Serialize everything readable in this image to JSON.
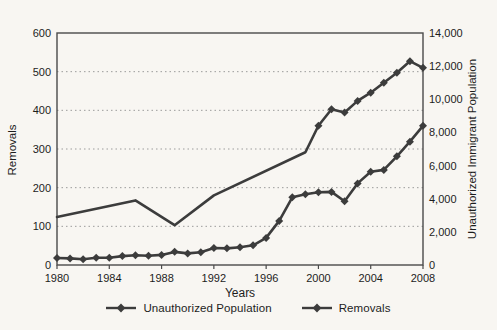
{
  "figure": {
    "background": "#f8f6f2",
    "text_color": "#1d1d1d"
  },
  "chart_data": {
    "type": "line",
    "title": "",
    "xlabel": "Years",
    "ylabel_left": "Removals",
    "ylabel_right": "Unauthorized Immigrant Population",
    "legend_position": "bottom-center",
    "grid": "horizontal dotted, left-axis intervals of 100",
    "line_color": "#3c3c3c",
    "grid_color": "#9c9c9c",
    "frame_color": "#4a4a4a",
    "x_axis": {
      "min": 1980,
      "max": 2008,
      "tick_years": [
        1980,
        1984,
        1988,
        1992,
        1996,
        2000,
        2004,
        2008
      ]
    },
    "left_axis": {
      "min": 0,
      "max": 600,
      "tick_values": [
        0,
        100,
        200,
        300,
        400,
        500,
        600
      ],
      "tick_labels": [
        "0",
        "100",
        "200",
        "300",
        "400",
        "500",
        "600"
      ]
    },
    "right_axis": {
      "min": 0,
      "max": 14000,
      "tick_values": [
        0,
        2000,
        4000,
        6000,
        8000,
        10000,
        12000,
        14000
      ],
      "tick_labels": [
        "0",
        "2,000",
        "4,000",
        "6,000",
        "8,000",
        "10,000",
        "12,000",
        "14,000"
      ]
    },
    "series": [
      {
        "name": "Unauthorized Population",
        "axis": "right",
        "marker": "diamond",
        "marker_start_year": 2000,
        "points": [
          [
            1980,
            2900
          ],
          [
            1986,
            3900
          ],
          [
            1989,
            2400
          ],
          [
            1992,
            4200
          ],
          [
            1999,
            6800
          ],
          [
            2000,
            8400
          ],
          [
            2001,
            9400
          ],
          [
            2002,
            9200
          ],
          [
            2003,
            9900
          ],
          [
            2004,
            10400
          ],
          [
            2005,
            11000
          ],
          [
            2006,
            11600
          ],
          [
            2007,
            12300
          ],
          [
            2008,
            11900
          ]
        ]
      },
      {
        "name": "Removals",
        "axis": "left",
        "marker": "diamond",
        "marker_start_year": 1980,
        "points": [
          [
            1980,
            18
          ],
          [
            1981,
            17
          ],
          [
            1982,
            15
          ],
          [
            1983,
            19
          ],
          [
            1984,
            19
          ],
          [
            1985,
            23
          ],
          [
            1986,
            25
          ],
          [
            1987,
            24
          ],
          [
            1988,
            26
          ],
          [
            1989,
            34
          ],
          [
            1990,
            30
          ],
          [
            1991,
            33
          ],
          [
            1992,
            44
          ],
          [
            1993,
            43
          ],
          [
            1994,
            46
          ],
          [
            1995,
            51
          ],
          [
            1996,
            70
          ],
          [
            1997,
            114
          ],
          [
            1998,
            175
          ],
          [
            1999,
            183
          ],
          [
            2000,
            188
          ],
          [
            2001,
            189
          ],
          [
            2002,
            165
          ],
          [
            2003,
            211
          ],
          [
            2004,
            241
          ],
          [
            2005,
            246
          ],
          [
            2006,
            281
          ],
          [
            2007,
            319
          ],
          [
            2008,
            360
          ]
        ]
      }
    ]
  }
}
